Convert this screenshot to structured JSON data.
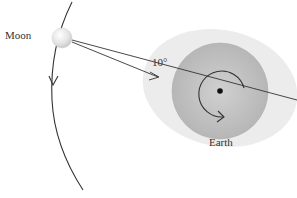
{
  "labels": {
    "moon": "Moon",
    "angle": "10°",
    "earth": "Earth"
  },
  "colors": {
    "tidal_bulge": "#ececec",
    "earth": "#bdbdbd",
    "moon": "#e4e4e4",
    "lines": "#333333",
    "center_dot": "#111111"
  },
  "elements": {
    "moon_orbit": "curved path with downward direction arrow",
    "earth_rotation": "counter-clockwise arc arrow around Earth's center",
    "force_lines": "two lines from Moon to Earth separated by 10° angle; one through Earth's center, one toward bulge"
  }
}
